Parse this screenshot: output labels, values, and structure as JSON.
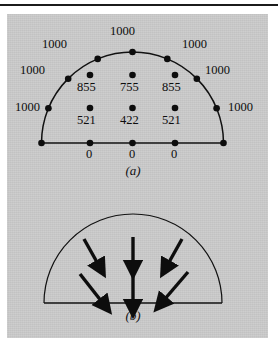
{
  "figure": {
    "background_color": "#c9c9c9",
    "page_color": "#ffffff",
    "ink_color": "#111111",
    "top_rule": true
  },
  "panels": [
    {
      "id": "a",
      "caption": "(a)",
      "description": "semicircular mesh with nodal head values",
      "shape": {
        "type": "semicircle",
        "center_x": 132.5,
        "baseline_y": 143,
        "radius": 91
      }
    },
    {
      "id": "b",
      "caption": "(b)",
      "description": "semicircular domain with flow direction arrows",
      "shape": {
        "type": "semicircle",
        "center_x": 133,
        "baseline_y": 303,
        "radius": 89
      }
    }
  ],
  "panel_a": {
    "caption": "(a)",
    "boundary_nodes": [
      {
        "label": "1000",
        "angle_deg": 180,
        "label_side": "left",
        "node_x": 41.5,
        "node_y": 143
      },
      {
        "label": "1000",
        "angle_deg": 157.5,
        "label_side": "left",
        "node_x": 48.4,
        "node_y": 108.2
      },
      {
        "label": "1000",
        "angle_deg": 135,
        "label_side": "upleft",
        "node_x": 68.2,
        "node_y": 78.7
      },
      {
        "label": "1000",
        "angle_deg": 112.5,
        "label_side": "up",
        "node_x": 97.7,
        "node_y": 58.9
      },
      {
        "label": "1000",
        "angle_deg": 90,
        "label_side": "up",
        "node_x": 132.5,
        "node_y": 52
      },
      {
        "label": "1000",
        "angle_deg": 67.5,
        "label_side": "up",
        "node_x": 167.3,
        "node_y": 58.9
      },
      {
        "label": "1000",
        "angle_deg": 45,
        "label_side": "upright",
        "node_x": 196.8,
        "node_y": 78.7
      },
      {
        "label": "1000",
        "angle_deg": 22.5,
        "label_side": "right",
        "node_x": 216.6,
        "node_y": 108.2
      },
      {
        "label": "1000",
        "angle_deg": 0,
        "label_side": "right",
        "node_x": 223.5,
        "node_y": 143
      }
    ],
    "interior_nodes": [
      {
        "label": "855",
        "node_x": 90,
        "node_y": 75
      },
      {
        "label": "755",
        "node_x": 132.5,
        "node_y": 75
      },
      {
        "label": "855",
        "node_x": 175,
        "node_y": 75
      },
      {
        "label": "521",
        "node_x": 90,
        "node_y": 108
      },
      {
        "label": "422",
        "node_x": 132.5,
        "node_y": 108
      },
      {
        "label": "521",
        "node_x": 175,
        "node_y": 108
      }
    ],
    "baseline_nodes": [
      {
        "label": "",
        "node_x": 41.5,
        "node_y": 143
      },
      {
        "label": "0",
        "node_x": 90,
        "node_y": 143
      },
      {
        "label": "0",
        "node_x": 132.5,
        "node_y": 143
      },
      {
        "label": "0",
        "node_x": 175,
        "node_y": 143
      },
      {
        "label": "",
        "node_x": 223.5,
        "node_y": 143
      }
    ]
  },
  "panel_b": {
    "caption": "(b)",
    "arrows": [
      {
        "x1": 84,
        "y1": 239,
        "x2": 99,
        "y2": 266,
        "name": "arrow-top-left"
      },
      {
        "x1": 133,
        "y1": 237,
        "x2": 133,
        "y2": 266,
        "name": "arrow-top-center"
      },
      {
        "x1": 182,
        "y1": 239,
        "x2": 167,
        "y2": 266,
        "name": "arrow-top-right"
      },
      {
        "x1": 80,
        "y1": 274,
        "x2": 103,
        "y2": 304,
        "name": "arrow-bottom-left"
      },
      {
        "x1": 133,
        "y1": 272,
        "x2": 133,
        "y2": 305,
        "name": "arrow-bottom-center"
      },
      {
        "x1": 188,
        "y1": 272,
        "x2": 163,
        "y2": 302,
        "name": "arrow-bottom-right"
      }
    ]
  }
}
